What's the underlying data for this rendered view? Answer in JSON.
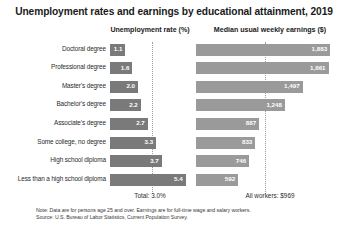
{
  "title": "Unemployment rates and earnings by educational attainment, 2019",
  "headers": {
    "unemployment": "Unemployment rate (%)",
    "earnings": "Median usual weekly earnings ($)"
  },
  "footer": {
    "total": "Total: 3.0%",
    "all_workers": "All workers: $969"
  },
  "notes": {
    "note": "Note: Data are for persons age 25 and over. Earnings are for full-time wage and salary workers.",
    "source": "Source: U.S. Bureau of Labor Statistics, Current Population Survey."
  },
  "colors": {
    "unemployment_bar": "#7a7a7a",
    "earnings_bar": "#9a9a9a",
    "reference_line": "#9b9b9b",
    "text": "#231f20",
    "background": "#ffffff"
  },
  "chart_data": {
    "type": "bar",
    "title": "Unemployment rates and earnings by educational attainment, 2019",
    "categories": [
      "Doctoral degree",
      "Professional degree",
      "Master's degree",
      "Bachelor's degree",
      "Associate's degree",
      "Some college, no degree",
      "High school diploma",
      "Less than a high school diploma"
    ],
    "series": [
      {
        "name": "Unemployment rate (%)",
        "values": [
          1.1,
          1.6,
          2.0,
          2.2,
          2.7,
          3.3,
          3.7,
          5.4
        ],
        "labels": [
          "1.1",
          "1.6",
          "2.0",
          "2.2",
          "2.7",
          "3.3",
          "3.7",
          "5.4"
        ],
        "reference_value": 3.0,
        "reference_label": "Total: 3.0%",
        "xlim": [
          0,
          6.0
        ]
      },
      {
        "name": "Median usual weekly earnings ($)",
        "values": [
          1883,
          1861,
          1497,
          1248,
          887,
          833,
          746,
          592
        ],
        "labels": [
          "1,883",
          "1,861",
          "1,497",
          "1,248",
          "887",
          "833",
          "746",
          "592"
        ],
        "reference_value": 969,
        "reference_label": "All workers: $969",
        "xlim": [
          0,
          2000
        ]
      }
    ],
    "orientation": "horizontal",
    "xlabel": "",
    "ylabel": "",
    "grid": false,
    "legend": false,
    "annotations": [
      "Note: Data are for persons age 25 and over. Earnings are for full-time wage and salary workers.",
      "Source: U.S. Bureau of Labor Statistics, Current Population Survey."
    ]
  }
}
